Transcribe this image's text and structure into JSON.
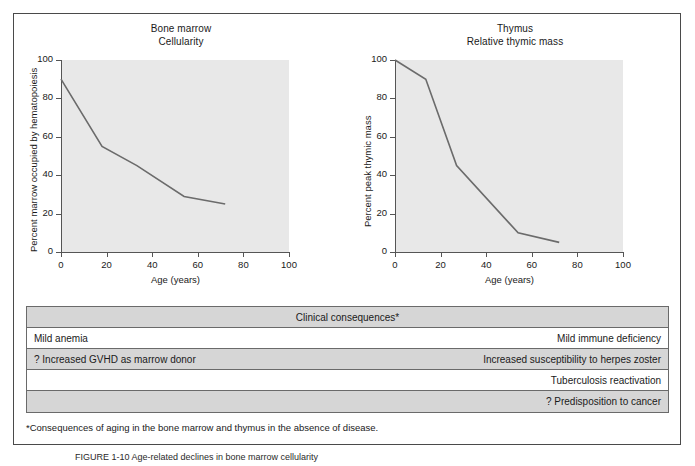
{
  "figure": {
    "footnote": "*Consequences of aging in the bone marrow and thymus in the absence of disease.",
    "caption": "FIGURE 1-10  Age-related declines in bone marrow cellularity"
  },
  "chart_data": [
    {
      "type": "line",
      "panel": "left",
      "title": "Bone marrow",
      "subtitle": "Cellularity",
      "xlabel": "Age (years)",
      "ylabel": "Percent marrow occupied by hematopoiesis",
      "xlim": [
        0,
        100
      ],
      "ylim": [
        0,
        100
      ],
      "xticks": [
        0,
        20,
        40,
        60,
        80,
        100
      ],
      "yticks": [
        0,
        20,
        40,
        60,
        80,
        100
      ],
      "grid": false,
      "legend": "none",
      "x": [
        0,
        20,
        37,
        60,
        80
      ],
      "values": [
        90,
        55,
        45,
        29,
        25
      ]
    },
    {
      "type": "line",
      "panel": "right",
      "title": "Thymus",
      "subtitle": "Relative thymic mass",
      "xlabel": "Age (years)",
      "ylabel": "Percent peak thymic mass",
      "xlim": [
        0,
        100
      ],
      "ylim": [
        0,
        100
      ],
      "xticks": [
        0,
        20,
        40,
        60,
        80,
        100
      ],
      "yticks": [
        0,
        20,
        40,
        60,
        80,
        100
      ],
      "grid": false,
      "legend": "none",
      "x": [
        0,
        15,
        30,
        60,
        80
      ],
      "values": [
        100,
        90,
        45,
        10,
        5
      ]
    }
  ],
  "table": {
    "header": "Clinical consequences*",
    "rows": [
      {
        "left": "Mild anemia",
        "right": "Mild immune deficiency",
        "shaded": false
      },
      {
        "left": "? Increased GVHD as marrow donor",
        "right": "Increased susceptibility to herpes zoster",
        "shaded": true
      },
      {
        "left": "",
        "right": "Tuberculosis reactivation",
        "shaded": false
      },
      {
        "left": "",
        "right": "? Predisposition to cancer",
        "shaded": true
      }
    ]
  }
}
